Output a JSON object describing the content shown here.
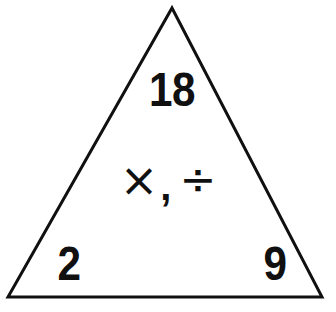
{
  "diagram": {
    "type": "number-fact-triangle",
    "background_color": "#ffffff",
    "stroke_color": "#101010",
    "text_color": "#101010",
    "stroke_width": 3,
    "shape": {
      "name": "triangle",
      "apex": {
        "x": 172,
        "y": 8
      },
      "bottom_left": {
        "x": 8,
        "y": 297
      },
      "bottom_right": {
        "x": 322,
        "y": 297
      }
    },
    "nodes": {
      "top": "18",
      "bottom_left": "2",
      "bottom_right": "9"
    },
    "operators": {
      "multiply": "×",
      "separator": ",",
      "divide": "÷"
    }
  }
}
